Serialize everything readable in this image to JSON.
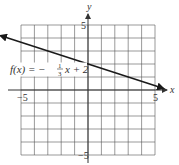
{
  "chart_data": {
    "type": "line",
    "title": "",
    "xlabel": "x",
    "ylabel": "y",
    "xlim": [
      -5,
      5
    ],
    "ylim": [
      -5,
      5
    ],
    "grid": true,
    "grid_step": 1,
    "x_tick_labels": [
      {
        "value": -5,
        "label": "−5"
      },
      {
        "value": 5,
        "label": "5"
      }
    ],
    "y_tick_labels": [
      {
        "value": 5,
        "label": "5"
      },
      {
        "value": -5,
        "label": "−5"
      }
    ],
    "series": [
      {
        "name": "f(x) = -1/3 x + 2",
        "slope": -0.3333,
        "intercept": 2,
        "x": [
          -6.5,
          5.6
        ],
        "y": [
          4.1667,
          0.1333
        ],
        "arrows": "both",
        "color": "#1a1a1a"
      }
    ],
    "annotations": [
      {
        "text_prefix": "f(x) = −",
        "frac_num": "1",
        "frac_den": "3",
        "text_suffix": "x + 2",
        "at": {
          "x": -6.0,
          "y": 1.5
        }
      }
    ]
  }
}
